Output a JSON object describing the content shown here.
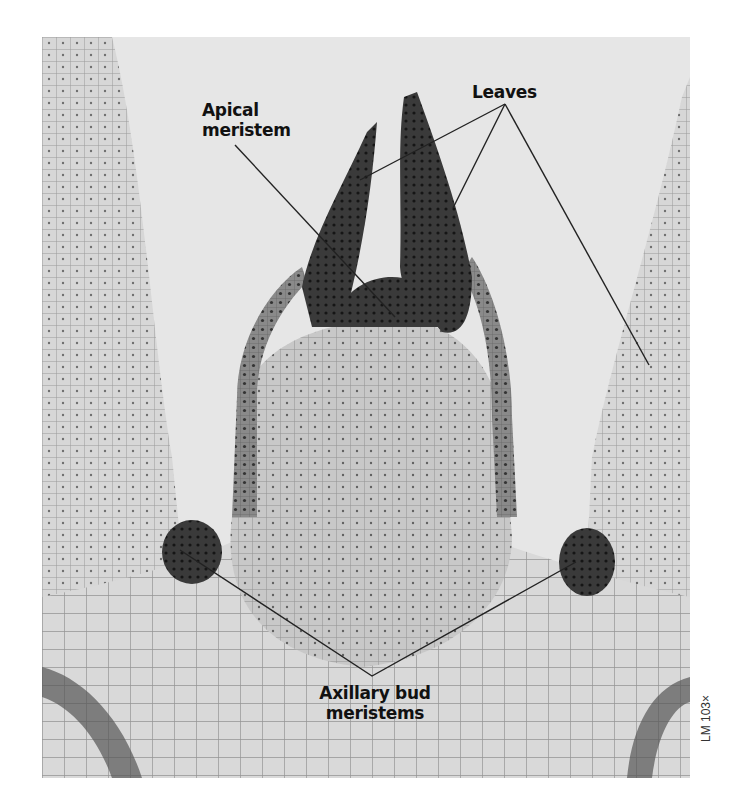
{
  "figure": {
    "colors": {
      "background": "#ffffff",
      "tissue_light": "#e4e4e4",
      "tissue_dark": "#2a2a2a",
      "label_text": "#111111",
      "leader_line": "#222222"
    },
    "labels": {
      "apical_meristem": {
        "line1": "Apical",
        "line2": "meristem"
      },
      "leaves": "Leaves",
      "axillary_bud_meristems": {
        "line1": "Axillary bud",
        "line2": "meristems"
      }
    },
    "scale_note": "LM 103×"
  }
}
